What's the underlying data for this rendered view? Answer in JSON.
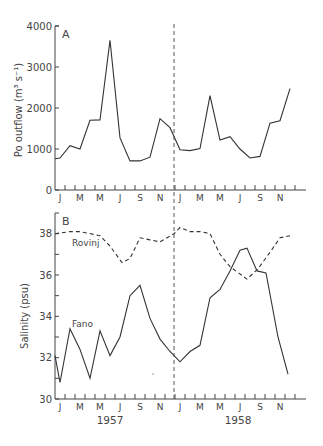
{
  "header_text": "",
  "chart_data": [
    {
      "panel": "A",
      "type": "line",
      "title": "",
      "xlabel": "",
      "ylabel": "Po outflow (m³ s⁻¹)",
      "ylim": [
        0,
        4000
      ],
      "yticks": [
        0,
        1000,
        2000,
        3000,
        4000
      ],
      "grid": false,
      "month_labels": [
        "J",
        "M",
        "M",
        "J",
        "S",
        "N",
        "J",
        "M",
        "M",
        "J",
        "S",
        "N"
      ],
      "divider_at": "Dec 1957 / Jan 1958 (dashed vertical line)",
      "series": [
        {
          "name": "Po outflow",
          "style": "solid",
          "x": [
            0,
            0.5,
            1.5,
            2.5,
            3.5,
            4.5,
            5.5,
            6.5,
            7.5,
            8.5,
            9.5,
            10.5,
            11.5,
            12.5,
            13.5,
            14.5,
            15.5,
            16.5,
            17.5,
            18.5,
            19.5,
            20.5,
            21.5,
            22.5,
            23.5
          ],
          "values": [
            760,
            780,
            1080,
            1000,
            1700,
            1710,
            3650,
            1270,
            710,
            710,
            800,
            1740,
            1520,
            980,
            960,
            1010,
            2300,
            1220,
            1300,
            1000,
            780,
            820,
            1630,
            1690,
            2470
          ]
        }
      ]
    },
    {
      "panel": "B",
      "type": "line",
      "title": "",
      "xlabel": "",
      "ylabel": "Salinity (psu)",
      "ylim": [
        30,
        39
      ],
      "yticks": [
        30,
        32,
        34,
        36,
        38
      ],
      "grid": false,
      "month_labels": [
        "J",
        "M",
        "M",
        "J",
        "S",
        "N",
        "J",
        "M",
        "M",
        "J",
        "S",
        "N"
      ],
      "year_labels": [
        "1957",
        "1958"
      ],
      "divider_at": "Dec 1957 / Jan 1958 (dashed vertical line)",
      "series": [
        {
          "name": "Rovinj",
          "style": "dashed",
          "x": [
            0,
            1.5,
            2.5,
            4.5,
            5.5,
            6.7,
            7.5,
            8.5,
            9.5,
            10.5,
            11.9,
            12.5,
            13.5,
            14.5,
            15.5,
            16.5,
            17.5,
            19.2,
            20.3,
            21.5,
            22.5,
            23.5
          ],
          "values": [
            38.0,
            38.1,
            38.1,
            37.9,
            37.4,
            36.6,
            36.8,
            37.8,
            37.7,
            37.6,
            38.0,
            38.3,
            38.1,
            38.1,
            38.0,
            37.0,
            36.4,
            35.8,
            36.3,
            37.1,
            37.8,
            37.9
          ]
        },
        {
          "name": "Fano",
          "style": "solid",
          "x": [
            0,
            0.5,
            1.5,
            2.5,
            3.5,
            4.5,
            5.5,
            6.5,
            7.5,
            8.5,
            9.5,
            10.5,
            11.5,
            12.5,
            13.5,
            14.5,
            15.5,
            16.5,
            17.5,
            18.5,
            19.2,
            20.2,
            21.1,
            22.3,
            23.3
          ],
          "values": [
            32.1,
            30.8,
            33.4,
            32.4,
            31.0,
            33.3,
            32.1,
            33.0,
            35.0,
            35.5,
            33.9,
            32.9,
            32.3,
            31.8,
            32.3,
            32.6,
            34.9,
            35.3,
            36.2,
            37.2,
            37.3,
            36.2,
            36.1,
            33.0,
            31.2
          ]
        }
      ]
    }
  ],
  "labels": {
    "panel_a": "A",
    "panel_b": "B",
    "ylabel_a": "Po outflow (m³ s⁻¹)",
    "ylabel_b": "Salinity (psu)",
    "series_rovinj": "Rovinj",
    "series_fano": "Fano",
    "year_1957": "1957",
    "year_1958": "1958"
  }
}
